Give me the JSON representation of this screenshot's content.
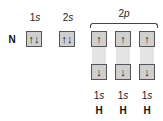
{
  "diagram": {
    "atom_label": "N",
    "orbitals": [
      {
        "label_num": "1",
        "label_sub": "s",
        "electrons": "↑↓"
      },
      {
        "label_num": "2",
        "label_sub": "s",
        "electrons": "↑↓"
      }
    ],
    "p_group": {
      "label_num": "2",
      "label_sub": "p",
      "orbitals": [
        {
          "n_electron": "↑",
          "h_electron": "↓",
          "h_label_num": "1",
          "h_label_sub": "s",
          "h_atom": "H"
        },
        {
          "n_electron": "↑",
          "h_electron": "↓",
          "h_label_num": "1",
          "h_label_sub": "s",
          "h_atom": "H"
        },
        {
          "n_electron": "↑",
          "h_electron": "↓",
          "h_label_num": "1",
          "h_label_sub": "s",
          "h_atom": "H"
        }
      ]
    }
  }
}
